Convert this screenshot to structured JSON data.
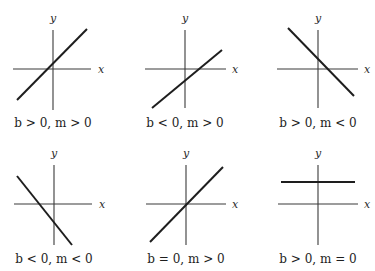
{
  "figure": {
    "axis_labels": {
      "x": "x",
      "y": "y"
    },
    "panels": [
      {
        "caption": "b > 0, m > 0",
        "b_sign": "positive",
        "m_sign": "positive"
      },
      {
        "caption": "b < 0, m > 0",
        "b_sign": "negative",
        "m_sign": "positive"
      },
      {
        "caption": "b > 0, m < 0",
        "b_sign": "positive",
        "m_sign": "negative"
      },
      {
        "caption": "b < 0, m < 0",
        "b_sign": "negative",
        "m_sign": "negative"
      },
      {
        "caption": "b = 0, m > 0",
        "b_sign": "zero",
        "m_sign": "positive"
      },
      {
        "caption": "b > 0, m = 0",
        "b_sign": "positive",
        "m_sign": "zero"
      }
    ]
  }
}
